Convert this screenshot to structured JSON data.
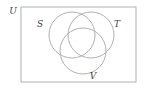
{
  "figure": {
    "type": "venn-diagram",
    "title": "",
    "background_color": "#ffffff",
    "stroke_color": "#b0b0b0",
    "label_color": "#3c3c3c",
    "universe": {
      "label": "U",
      "shape": "rectangle",
      "x": 21,
      "y": 7,
      "width": 115,
      "height": 75,
      "label_x": 13,
      "label_y": 14
    },
    "sets": [
      {
        "label": "S",
        "cx": 72,
        "cy": 35,
        "r": 23,
        "label_x": 40,
        "label_y": 27
      },
      {
        "label": "T",
        "cx": 91,
        "cy": 35,
        "r": 23,
        "label_x": 117,
        "label_y": 27
      },
      {
        "label": "V",
        "cx": 83,
        "cy": 51,
        "r": 23,
        "label_x": 93,
        "label_y": 79
      }
    ]
  }
}
